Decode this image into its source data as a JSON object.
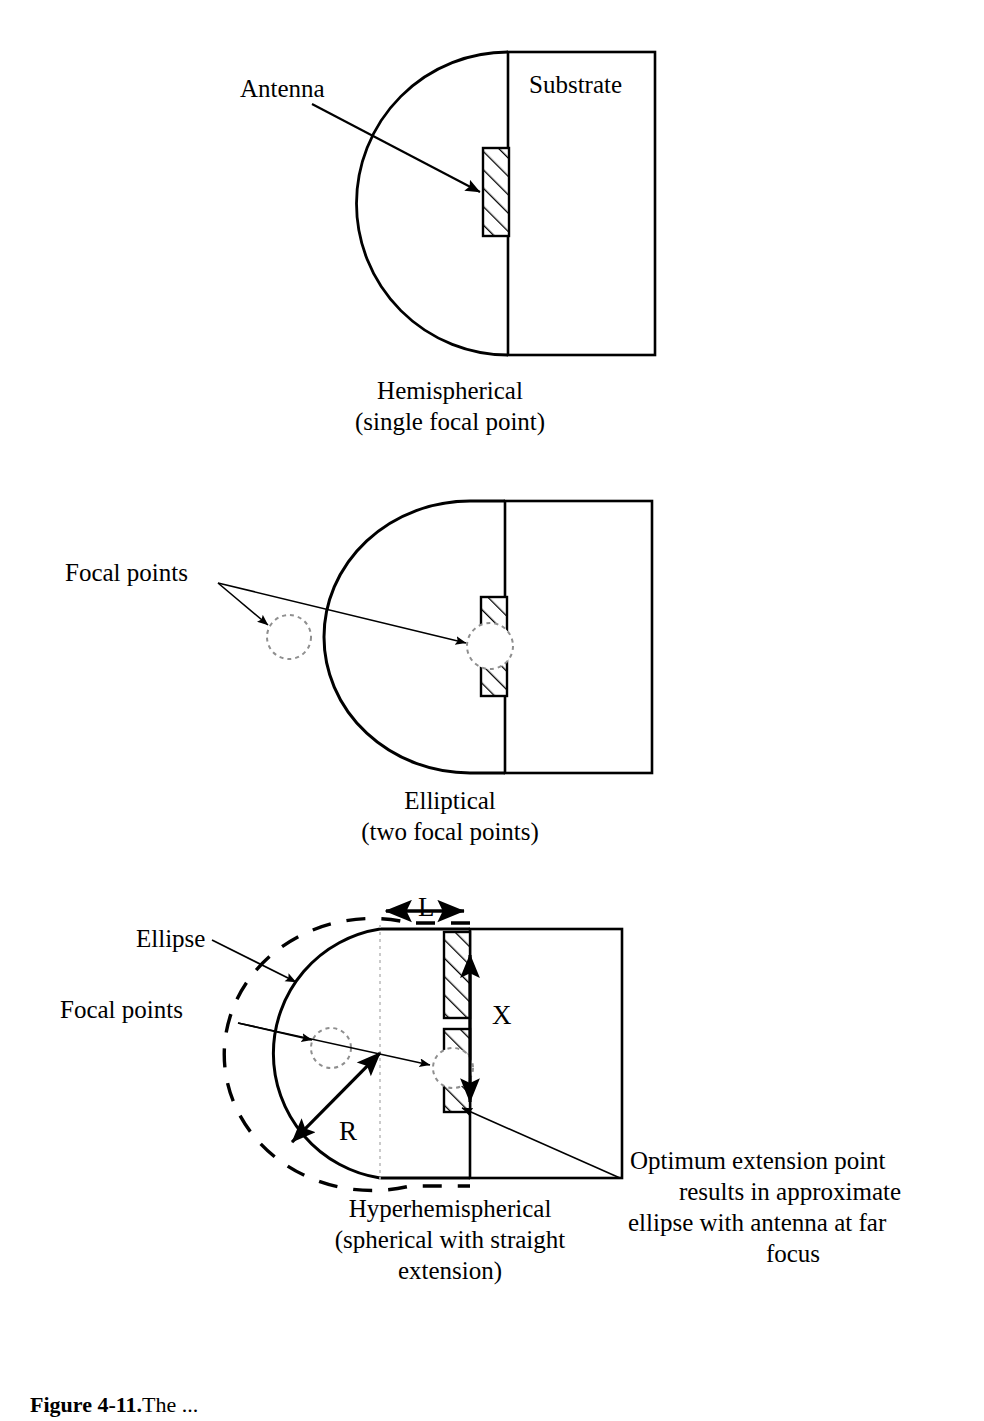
{
  "figure": {
    "stroke_color": "#000000",
    "background_color": "#ffffff",
    "hatch_color": "#000000",
    "dashed_color": "#000000",
    "faint_guide_color": "#9a9a9a"
  },
  "panel1": {
    "id": "hemispherical",
    "annotation_label": "Antenna",
    "substrate_label": "Substrate",
    "caption_line1": "Hemispherical",
    "caption_line2": "(single focal point)"
  },
  "panel2": {
    "id": "elliptical",
    "annotation_label": "Focal points",
    "caption_line1": "Elliptical",
    "caption_line2": "(two focal points)"
  },
  "panel3": {
    "id": "hyperhemispherical",
    "ellipse_label": "Ellipse",
    "focal_label": "Focal points",
    "dim_l_label": "L",
    "dim_x_label": "X",
    "dim_r_label": "R",
    "note_line1": "Optimum extension point",
    "note_line2": "results in approximate",
    "note_line3": "ellipse with antenna at far",
    "note_line4": "focus",
    "caption_line1": "Hyperhemispherical",
    "caption_line2": "(spherical with straight",
    "caption_line3": "extension)"
  },
  "figure_caption": {
    "number": "Figure 4-11.",
    "text": "The ..."
  }
}
